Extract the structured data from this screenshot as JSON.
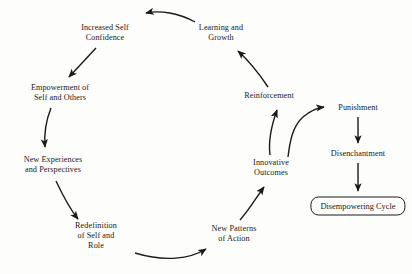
{
  "diagram": {
    "type": "cycle-diagram",
    "title": "",
    "stroke_color": "#1a1a1a",
    "background_color": "#fdfdfb",
    "nodes": [
      {
        "id": "increased-self-confidence",
        "lines": [
          "Increased Self",
          "Confidence"
        ],
        "x": 105,
        "y": 33,
        "boxed": false
      },
      {
        "id": "learning-and-growth",
        "lines": [
          "Learning and",
          "Growth"
        ],
        "x": 221,
        "y": 33,
        "boxed": false
      },
      {
        "id": "empowerment-of-self-and-others",
        "lines": [
          "Empowerment of",
          "Self and Others"
        ],
        "x": 60,
        "y": 93,
        "boxed": false
      },
      {
        "id": "reinforcement",
        "lines": [
          "Reinforcement"
        ],
        "x": 269,
        "y": 96,
        "boxed": false
      },
      {
        "id": "punishment",
        "lines": [
          "Punishment"
        ],
        "x": 358,
        "y": 108,
        "boxed": false
      },
      {
        "id": "new-experiences-and-perspectives",
        "lines": [
          "New Experiences",
          "and Perspectives"
        ],
        "x": 53,
        "y": 165,
        "boxed": false
      },
      {
        "id": "disenchantment",
        "lines": [
          "Disenchantment"
        ],
        "x": 358,
        "y": 154,
        "boxed": false
      },
      {
        "id": "innovative-outcomes",
        "lines": [
          "Innovative",
          "Outcomes"
        ],
        "x": 271,
        "y": 168,
        "boxed": false
      },
      {
        "id": "disempowering-cycle",
        "lines": [
          "Disempowering Cycle"
        ],
        "x": 344,
        "y": 206,
        "boxed": true
      },
      {
        "id": "redefinition-of-self-and-role",
        "lines": [
          "Redefinition",
          "of Self and",
          "Role"
        ],
        "x": 96,
        "y": 236,
        "boxed": false
      },
      {
        "id": "new-patterns-of-action",
        "lines": [
          "New Patterns",
          "of Action"
        ],
        "x": 234,
        "y": 234,
        "boxed": false
      }
    ],
    "edges": [
      {
        "id": "learning-to-confidence",
        "from": "learning-and-growth",
        "to": "increased-self-confidence",
        "style": "curved"
      },
      {
        "id": "confidence-to-empowerment",
        "from": "increased-self-confidence",
        "to": "empowerment-of-self-and-others",
        "style": "straight"
      },
      {
        "id": "empowerment-to-new-experiences",
        "from": "empowerment-of-self-and-others",
        "to": "new-experiences-and-perspectives",
        "style": "curved"
      },
      {
        "id": "new-experiences-to-redefinition",
        "from": "new-experiences-and-perspectives",
        "to": "redefinition-of-self-and-role",
        "style": "curved"
      },
      {
        "id": "redefinition-to-new-patterns",
        "from": "redefinition-of-self-and-role",
        "to": "new-patterns-of-action",
        "style": "curved"
      },
      {
        "id": "new-patterns-to-innovative-outcomes",
        "from": "new-patterns-of-action",
        "to": "innovative-outcomes",
        "style": "curved"
      },
      {
        "id": "innovative-outcomes-to-reinforcement",
        "from": "innovative-outcomes",
        "to": "reinforcement",
        "style": "curved"
      },
      {
        "id": "reinforcement-to-learning",
        "from": "reinforcement",
        "to": "learning-and-growth",
        "style": "curved"
      },
      {
        "id": "innovative-outcomes-to-punishment",
        "from": "innovative-outcomes",
        "to": "punishment",
        "style": "curved"
      },
      {
        "id": "punishment-to-disenchantment",
        "from": "punishment",
        "to": "disenchantment",
        "style": "straight"
      },
      {
        "id": "disenchantment-to-disempowering-cycle",
        "from": "disenchantment",
        "to": "disempowering-cycle",
        "style": "straight"
      }
    ]
  }
}
